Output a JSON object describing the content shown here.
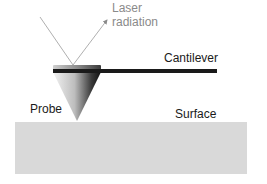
{
  "diagram": {
    "labels": {
      "laser_line1": "Laser",
      "laser_line2": "radiation",
      "cantilever": "Cantilever",
      "probe": "Probe",
      "surface": "Surface"
    },
    "colors": {
      "background": "#ffffff",
      "surface_fill": "#d9d9d9",
      "cantilever": "#1a1a1a",
      "laser_beam": "#9a9a9a",
      "label_text": "#1a1a1a",
      "laser_text": "#8a8a8a"
    },
    "icons": {
      "laser_arrow": "arrow-up-right-icon",
      "probe": "cone-probe-icon"
    }
  }
}
